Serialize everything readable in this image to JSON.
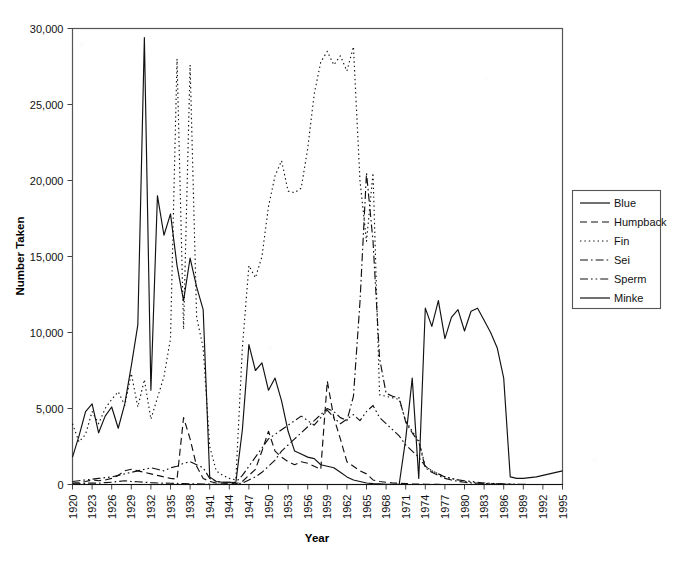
{
  "chart_data": {
    "type": "line",
    "title": "",
    "xlabel": "Year",
    "ylabel": "Number Taken",
    "xlim": [
      1920,
      1995
    ],
    "ylim": [
      0,
      30000
    ],
    "ytick_values": [
      0,
      5000,
      10000,
      15000,
      20000,
      25000,
      30000
    ],
    "ytick_labels": [
      "0",
      "5,000",
      "10,000",
      "15,000",
      "20,000",
      "25,000",
      "30,000"
    ],
    "xtick_labels": [
      "1920",
      "1923",
      "1926",
      "1929",
      "1932",
      "1935",
      "1938",
      "1941",
      "1944",
      "1947",
      "1950",
      "1953",
      "1956",
      "1959",
      "1962",
      "1965",
      "1968",
      "1971",
      "1974",
      "1977",
      "1980",
      "1983",
      "1986",
      "1989",
      "1992",
      "1995"
    ],
    "grid": false,
    "legend_position": "right",
    "x": [
      1920,
      1921,
      1922,
      1923,
      1924,
      1925,
      1926,
      1927,
      1928,
      1929,
      1930,
      1931,
      1932,
      1933,
      1934,
      1935,
      1936,
      1937,
      1938,
      1939,
      1940,
      1941,
      1942,
      1943,
      1944,
      1945,
      1946,
      1947,
      1948,
      1949,
      1950,
      1951,
      1952,
      1953,
      1954,
      1955,
      1956,
      1957,
      1958,
      1959,
      1960,
      1961,
      1962,
      1963,
      1964,
      1965,
      1966,
      1967,
      1968,
      1969,
      1970,
      1971,
      1972,
      1973,
      1974,
      1975,
      1976,
      1977,
      1978,
      1979,
      1980,
      1981,
      1982,
      1983,
      1984,
      1985,
      1986,
      1987,
      1988,
      1989,
      1990,
      1991,
      1992,
      1993,
      1994,
      1995
    ],
    "series": [
      {
        "name": "Blue",
        "style": "solid",
        "values": [
          1800,
          3200,
          4800,
          5300,
          3400,
          4500,
          5100,
          3700,
          5300,
          7800,
          10500,
          29400,
          6200,
          19000,
          16400,
          17800,
          14400,
          12100,
          14900,
          13000,
          11500,
          500,
          200,
          150,
          150,
          120,
          3600,
          9200,
          7500,
          8000,
          6200,
          7000,
          5500,
          3500,
          2200,
          2000,
          1800,
          1700,
          1300,
          1200,
          1100,
          800,
          500,
          300,
          200,
          100,
          60,
          40,
          20,
          10,
          5,
          0,
          0,
          0,
          0,
          0,
          0,
          0,
          0,
          0,
          0,
          0,
          0,
          0,
          0,
          0,
          0,
          0,
          0,
          0,
          0,
          0,
          0,
          0,
          0,
          0
        ]
      },
      {
        "name": "Humpback",
        "style": "dashed",
        "values": [
          100,
          120,
          200,
          300,
          250,
          300,
          400,
          600,
          900,
          1000,
          900,
          800,
          700,
          600,
          500,
          400,
          350,
          4400,
          3000,
          1200,
          400,
          200,
          100,
          80,
          60,
          50,
          200,
          600,
          1000,
          2200,
          3500,
          2200,
          1800,
          1500,
          1300,
          1500,
          1400,
          1200,
          1000,
          6800,
          4400,
          3000,
          1500,
          1200,
          900,
          700,
          300,
          200,
          150,
          100,
          80,
          60,
          40,
          30,
          20,
          10,
          5,
          0,
          0,
          0,
          0,
          0,
          0,
          0,
          0,
          0,
          0,
          0,
          0,
          0,
          0,
          0,
          0,
          0,
          0,
          0
        ]
      },
      {
        "name": "Fin",
        "style": "dotted",
        "values": [
          4000,
          2800,
          3300,
          4800,
          4000,
          5000,
          5600,
          6100,
          5200,
          7300,
          5100,
          6900,
          4300,
          5700,
          7100,
          9600,
          28000,
          10200,
          27600,
          11000,
          9000,
          2500,
          900,
          600,
          400,
          300,
          9000,
          14400,
          13600,
          15000,
          18300,
          20300,
          21300,
          19300,
          19200,
          19500,
          22100,
          25700,
          27800,
          28500,
          27600,
          28200,
          27200,
          28800,
          20000,
          16000,
          20500,
          5900,
          5800,
          5700,
          5600,
          4200,
          3500,
          2900,
          1200,
          900,
          700,
          500,
          400,
          300,
          200,
          150,
          100,
          80,
          60,
          40,
          20,
          10,
          5,
          0,
          0,
          0,
          0,
          0,
          0,
          0
        ]
      },
      {
        "name": "Sei",
        "style": "dashdot",
        "values": [
          50,
          60,
          80,
          100,
          90,
          120,
          150,
          200,
          250,
          200,
          180,
          150,
          120,
          100,
          90,
          80,
          70,
          60,
          50,
          40,
          30,
          20,
          10,
          10,
          10,
          10,
          100,
          300,
          500,
          800,
          1200,
          1600,
          2200,
          2600,
          3000,
          3400,
          3800,
          4200,
          4600,
          5000,
          4800,
          4400,
          4200,
          5800,
          12000,
          20500,
          16000,
          8300,
          6000,
          5800,
          5700,
          4100,
          3400,
          2800,
          1100,
          800,
          600,
          400,
          300,
          200,
          150,
          100,
          80,
          60,
          40,
          20,
          10,
          5,
          0,
          0,
          0,
          0,
          0,
          0,
          0,
          0
        ]
      },
      {
        "name": "Sperm",
        "style": "dashdotdot",
        "values": [
          200,
          250,
          300,
          350,
          400,
          450,
          500,
          600,
          700,
          800,
          900,
          1000,
          1100,
          1000,
          900,
          1100,
          1200,
          1400,
          1500,
          1300,
          1100,
          400,
          200,
          150,
          150,
          150,
          600,
          1200,
          1800,
          2400,
          3000,
          3300,
          3600,
          3900,
          4200,
          4500,
          4200,
          3900,
          4400,
          4900,
          4400,
          4000,
          4300,
          4600,
          4200,
          4800,
          5200,
          4400,
          4000,
          3600,
          3200,
          2600,
          2200,
          1800,
          1200,
          900,
          700,
          500,
          400,
          300,
          250,
          200,
          150,
          100,
          80,
          60,
          40,
          20,
          10,
          5,
          0,
          0,
          0,
          0,
          0,
          0
        ]
      },
      {
        "name": "Minke",
        "style": "solid",
        "values": [
          0,
          0,
          0,
          0,
          0,
          0,
          0,
          0,
          0,
          0,
          0,
          0,
          0,
          0,
          0,
          0,
          0,
          0,
          0,
          0,
          0,
          0,
          0,
          0,
          0,
          0,
          0,
          0,
          0,
          0,
          0,
          0,
          0,
          0,
          0,
          0,
          0,
          0,
          0,
          0,
          0,
          0,
          0,
          0,
          0,
          0,
          0,
          0,
          0,
          0,
          0,
          3000,
          7000,
          400,
          11600,
          10400,
          12100,
          9600,
          11000,
          11500,
          10100,
          11400,
          11600,
          10800,
          10000,
          9000,
          7000,
          500,
          400,
          400,
          450,
          500,
          600,
          700,
          800,
          900
        ]
      }
    ]
  },
  "legend": {
    "entries": [
      {
        "label": "Blue",
        "style": "solid"
      },
      {
        "label": "Humpback",
        "style": "dashed"
      },
      {
        "label": "Fin",
        "style": "dotted"
      },
      {
        "label": "Sei",
        "style": "dashdot"
      },
      {
        "label": "Sperm",
        "style": "dashdotdot"
      },
      {
        "label": "Minke",
        "style": "solid"
      }
    ]
  }
}
